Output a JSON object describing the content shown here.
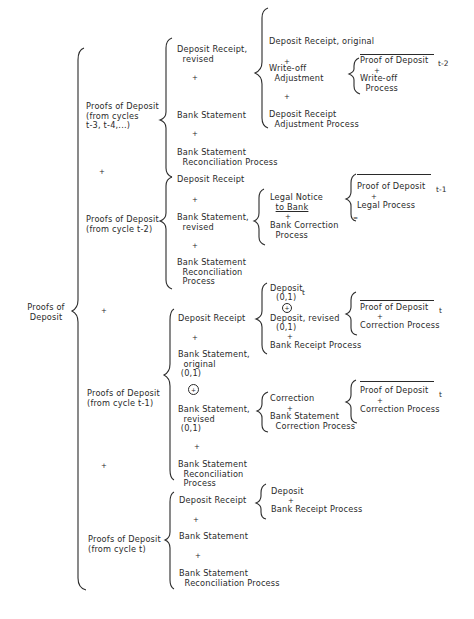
{
  "diagram": {
    "root": {
      "label_line1": "Proofs of",
      "label_line2": "Deposit"
    },
    "plus": "+",
    "oplus": "+",
    "groups": {
      "g3": {
        "label_line1": "Proofs of Deposit",
        "label_line2": "(from cycles",
        "label_line3": "t-3, t-4,...)",
        "item1_line1": "Deposit Receipt,",
        "item1_line2": "revised",
        "item2": "Bank Statement",
        "item3_line1": "Bank Statement",
        "item3_line2": "Reconciliation Process",
        "sub": {
          "a": "Deposit Receipt, original",
          "b_line1": "Write-off",
          "b_line2": "Adjustment",
          "c_line1": "Deposit Receipt",
          "c_line2": "Adjustment Process",
          "subsub": {
            "a": "Proof of Deposit",
            "a_sub": "t-2",
            "b_line1": "Write-off",
            "b_line2": "Process"
          }
        }
      },
      "g2": {
        "label_line1": "Proofs of Deposit",
        "label_line2": "(from cycle t-2)",
        "item1": "Deposit Receipt",
        "item2_line1": "Bank Statement,",
        "item2_line2": "revised",
        "item3_line1": "Bank Statement",
        "item3_line2": "Reconciliation",
        "item3_line3": "Process",
        "sub": {
          "a_line1": "Legal Notice",
          "a_line2": "to Bank",
          "b_line1": "Bank Correction",
          "b_line2": "Process",
          "subsub": {
            "a": "Proof of Deposit",
            "a_sub": "t-1",
            "b": "Legal Process",
            "eq": "="
          }
        }
      },
      "g1": {
        "label_line1": "Proofs of Deposit",
        "label_line2": "(from cycle t-1)",
        "item1": "Deposit Receipt",
        "item2_line1": "Bank Statement,",
        "item2_line2": "original",
        "item2_line3": "(0,1)",
        "item3_line1": "Bank Statement,",
        "item3_line2": "revised",
        "item3_line3": "(0,1)",
        "item4_line1": "Bank Statement",
        "item4_line2": "Reconciliation",
        "item4_line3": "Process",
        "subA": {
          "a": "Deposit",
          "a_sub": "t",
          "a_line2": "(0,1)",
          "b": "Deposit, revised",
          "b_line2": "(0,1)",
          "c": "Bank Receipt Process",
          "subsub": {
            "a": "Proof of Deposit",
            "a_sub": "t",
            "b": "Correction Process"
          }
        },
        "subB": {
          "a": "Correction",
          "b_line1": "Bank Statement",
          "b_line2": "Correction Process",
          "subsub": {
            "a": "Proof of Deposit",
            "a_sub": "t",
            "b": "Correction Process"
          }
        }
      },
      "g0": {
        "label_line1": "Proofs of Deposit",
        "label_line2": "(from cycle t)",
        "item1": "Deposit Receipt",
        "item2": "Bank Statement",
        "item3_line1": "Bank Statement",
        "item3_line2": "Reconciliation Process",
        "sub": {
          "a": "Deposit",
          "b": "Bank Receipt Process"
        }
      }
    }
  }
}
